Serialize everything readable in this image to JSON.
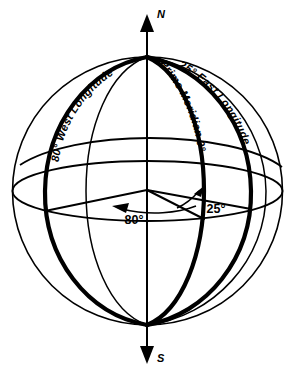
{
  "figure": {
    "name": "longitude-globe-diagram",
    "type": "wireframe-globe",
    "background_color": "#ffffff",
    "line_color": "#000000"
  },
  "axis": {
    "north_label": "N",
    "south_label": "S"
  },
  "meridians": [
    {
      "id": "west",
      "label": "80° West Longitude",
      "longitude_degrees": -80,
      "weight": "bold"
    },
    {
      "id": "prime",
      "label": "Prime Meridian 0°",
      "longitude_degrees": 0,
      "weight": "bold"
    },
    {
      "id": "east",
      "label": "25° East Longitude",
      "longitude_degrees": 25,
      "weight": "bold"
    }
  ],
  "angles": [
    {
      "id": "west-angle",
      "label": "80°",
      "value": 80,
      "direction": "west"
    },
    {
      "id": "east-angle",
      "label": "25°",
      "value": 25,
      "direction": "east"
    }
  ],
  "equator": {
    "name": "equator",
    "label": ""
  }
}
